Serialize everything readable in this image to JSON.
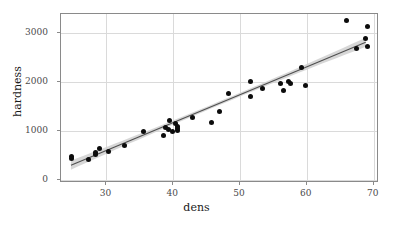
{
  "chart_data": {
    "type": "scatter",
    "title": "",
    "xlabel": "dens",
    "ylabel": "hardness",
    "xlim": [
      23.2,
      70.8
    ],
    "ylim": [
      -70,
      3400
    ],
    "xticks": [
      30,
      40,
      50,
      60,
      70
    ],
    "yticks": [
      0,
      1000,
      2000,
      3000
    ],
    "xtick_labels": [
      "30",
      "40",
      "50",
      "60",
      "70"
    ],
    "ytick_labels": [
      "0",
      "1000",
      "2000",
      "3000"
    ],
    "grid": true,
    "legend": "none",
    "point_color": "#0c0c0c",
    "line_color": "#4f4f4f",
    "band_color": "#d0d0d0",
    "panel_border_color": "#8a8a8a",
    "gridline_color": "#dadada",
    "background_color": "#ffffff",
    "series": [
      {
        "name": "hardness",
        "x": [
          24.7,
          24.8,
          27.3,
          28.4,
          28.4,
          29.0,
          30.3,
          32.7,
          35.6,
          38.5,
          38.8,
          39.3,
          39.4,
          39.9,
          40.3,
          40.6,
          40.7,
          40.7,
          42.9,
          45.8,
          46.9,
          48.2,
          51.5,
          51.5,
          53.4,
          56.0,
          56.5,
          57.3,
          57.6,
          59.2,
          59.8,
          66.0,
          67.4,
          68.8,
          69.1,
          69.1
        ],
        "y": [
          484,
          427,
          413,
          517,
          549,
          648,
          587,
          704,
          979,
          914,
          1070,
          1020,
          1210,
          989,
          1160,
          1010,
          1100,
          1058,
          1270,
          1180,
          1400,
          1760,
          1710,
          2010,
          1880,
          1980,
          1820,
          2020,
          1980,
          2310,
          1940,
          3260,
          2700,
          2890,
          2740,
          3140
        ]
      }
    ],
    "fit": {
      "type": "linear regression with confidence band",
      "intercept": -1160.5,
      "slope": 57.5,
      "x_start": 24.7,
      "x_end": 69.1,
      "ci_halfwidth_at_ends": 95,
      "ci_halfwidth_at_center": 38
    }
  },
  "axes": {
    "x_title": "dens",
    "y_title": "hardness"
  }
}
